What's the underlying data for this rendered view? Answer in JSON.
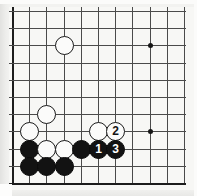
{
  "diagram": {
    "kind": "go-board-diagram",
    "board": {
      "origin_x": 3,
      "origin_y": 4,
      "spacing": 17.2,
      "columns": 11,
      "rows": 11,
      "line_color": "#4a4a4a",
      "edge_color": "#1c1c1c",
      "background_color": "#f7f7f5"
    },
    "star_points": [
      {
        "col": 8,
        "row": 2
      },
      {
        "col": 8,
        "row": 7
      }
    ],
    "stones": [
      {
        "color": "white",
        "col": 3,
        "row": 2,
        "label": ""
      },
      {
        "color": "white",
        "col": 2,
        "row": 6,
        "label": ""
      },
      {
        "color": "white",
        "col": 1,
        "row": 7,
        "label": ""
      },
      {
        "color": "white",
        "col": 5,
        "row": 7,
        "label": ""
      },
      {
        "color": "white",
        "col": 6,
        "row": 7,
        "label": "2"
      },
      {
        "color": "black",
        "col": 1,
        "row": 8,
        "label": ""
      },
      {
        "color": "white",
        "col": 2,
        "row": 8,
        "label": ""
      },
      {
        "color": "white",
        "col": 3,
        "row": 8,
        "label": ""
      },
      {
        "color": "black",
        "col": 4,
        "row": 8,
        "label": ""
      },
      {
        "color": "black",
        "col": 5,
        "row": 8,
        "label": "1"
      },
      {
        "color": "black",
        "col": 6,
        "row": 8,
        "label": "3"
      },
      {
        "color": "black",
        "col": 1,
        "row": 9,
        "label": ""
      },
      {
        "color": "black",
        "col": 2,
        "row": 9,
        "label": ""
      },
      {
        "color": "black",
        "col": 3,
        "row": 9,
        "label": ""
      }
    ],
    "move_numbers": [
      "1",
      "2",
      "3"
    ],
    "colors": {
      "black_stone": "#121212",
      "white_stone": "#fbfbfa",
      "page_background": "#f2f2f0"
    }
  }
}
